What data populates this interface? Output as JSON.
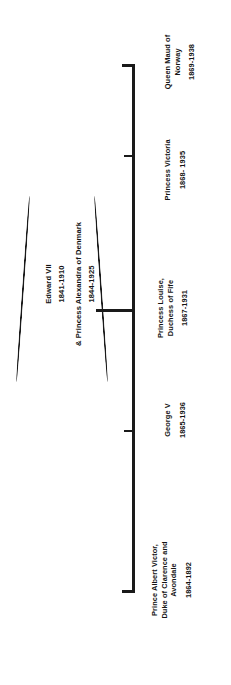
{
  "diagram": {
    "orientation": "rotated-90",
    "line_color": "#1a1a1a",
    "text_color": "#141414",
    "background": "#ffffff"
  },
  "parents": {
    "person_1_name": "Edward VII",
    "person_1_years": "1841-1910",
    "person_2_name": "& Princess Alexandra of Denmark",
    "person_2_years": "1844-1925"
  },
  "children": [
    {
      "id": "albert-victor",
      "name": "Prince Albert Victor, Duke of Clarence and Avondale",
      "name_lines": [
        "Prince Albert Victor,",
        "Duke of Clarence and",
        "Avondale"
      ],
      "years": "1864-1892"
    },
    {
      "id": "george-v",
      "name": "George V",
      "name_lines": [
        "George V"
      ],
      "years": "1865-1936"
    },
    {
      "id": "louise",
      "name": "Princess Louise, Duchess of Fife",
      "name_lines": [
        "Princess Louise,",
        "Duchess of Fife"
      ],
      "years": "1867-1931"
    },
    {
      "id": "victoria",
      "name": "Princess Victoria",
      "name_lines": [
        "Princess Victoria"
      ],
      "years": "1868- 1935"
    },
    {
      "id": "maud",
      "name": "Queen Maud of Norway",
      "name_lines": [
        "Queen Maud of",
        "Norway"
      ],
      "years": "1869-1938"
    }
  ]
}
